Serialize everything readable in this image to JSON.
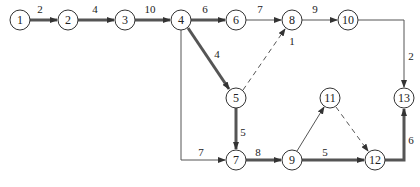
{
  "diagram": {
    "type": "activity-on-arrow network",
    "nodes": [
      {
        "id": "1",
        "label": "1",
        "x": 20,
        "y": 20
      },
      {
        "id": "2",
        "label": "2",
        "x": 68,
        "y": 20
      },
      {
        "id": "3",
        "label": "3",
        "x": 125,
        "y": 20
      },
      {
        "id": "4",
        "label": "4",
        "x": 181,
        "y": 20
      },
      {
        "id": "6",
        "label": "6",
        "x": 236,
        "y": 20
      },
      {
        "id": "8",
        "label": "8",
        "x": 292,
        "y": 20
      },
      {
        "id": "10",
        "label": "10",
        "x": 348,
        "y": 20
      },
      {
        "id": "5",
        "label": "5",
        "x": 236,
        "y": 98
      },
      {
        "id": "7",
        "label": "7",
        "x": 236,
        "y": 160
      },
      {
        "id": "9",
        "label": "9",
        "x": 292,
        "y": 160
      },
      {
        "id": "11",
        "label": "11",
        "x": 330,
        "y": 98
      },
      {
        "id": "12",
        "label": "12",
        "x": 375,
        "y": 160
      },
      {
        "id": "13",
        "label": "13",
        "x": 404,
        "y": 98
      }
    ],
    "edges": [
      {
        "from": "1",
        "to": "2",
        "label": "2",
        "style": "thick"
      },
      {
        "from": "2",
        "to": "3",
        "label": "4",
        "style": "thick"
      },
      {
        "from": "3",
        "to": "4",
        "label": "10",
        "style": "thick"
      },
      {
        "from": "4",
        "to": "6",
        "label": "6",
        "style": "thick"
      },
      {
        "from": "6",
        "to": "8",
        "label": "7",
        "style": "thin"
      },
      {
        "from": "8",
        "to": "10",
        "label": "9",
        "style": "thin"
      },
      {
        "from": "4",
        "to": "5",
        "label": "4",
        "style": "thick"
      },
      {
        "from": "5",
        "to": "8",
        "label": "1",
        "style": "dashed"
      },
      {
        "from": "4",
        "to": "7",
        "label": "7",
        "style": "thin"
      },
      {
        "from": "5",
        "to": "7",
        "label": "5",
        "style": "thick"
      },
      {
        "from": "7",
        "to": "9",
        "label": "8",
        "style": "thick"
      },
      {
        "from": "9",
        "to": "11",
        "label": "",
        "style": "thin"
      },
      {
        "from": "11",
        "to": "12",
        "label": "",
        "style": "dashed"
      },
      {
        "from": "9",
        "to": "12",
        "label": "5",
        "style": "thick"
      },
      {
        "from": "10",
        "to": "13",
        "label": "2",
        "style": "thin"
      },
      {
        "from": "12",
        "to": "13",
        "label": "6",
        "style": "thick"
      }
    ]
  },
  "colors": {
    "line": "#555555",
    "node_stroke": "#333333",
    "text": "#222222"
  }
}
